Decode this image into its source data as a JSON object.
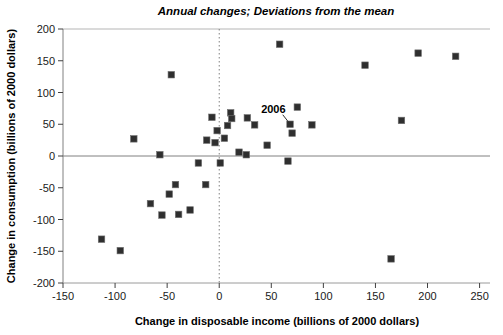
{
  "chart_data": {
    "type": "scatter",
    "title": "Annual changes; Deviations from the mean",
    "xlabel": "Change in disposable income (billions of 2000 dollars)",
    "ylabel": "Change in consumption (billions of 2000 dollars)",
    "xlim": [
      -150,
      260
    ],
    "ylim": [
      -200,
      200
    ],
    "x_ticks": [
      -150,
      -100,
      -50,
      0,
      50,
      100,
      150,
      200,
      250
    ],
    "y_ticks": [
      200,
      150,
      100,
      50,
      0,
      -50,
      -100,
      -150,
      -200
    ],
    "grid": false,
    "legend": null,
    "marker": {
      "shape": "square",
      "color": "#2f2f2f",
      "edge_color": "#6e6e6e",
      "size": 6.5
    },
    "reference_lines": {
      "horizontal_zero": {
        "value": 0,
        "style": "solid",
        "color": "#808080"
      },
      "vertical_zero": {
        "value": 0,
        "style": "dashed",
        "color": "#808080"
      }
    },
    "annotation": {
      "label": "2006",
      "label_at": [
        52,
        74
      ],
      "leader": [
        [
          61,
          65
        ],
        [
          66.5,
          53.5
        ]
      ],
      "point": [
        68,
        50
      ]
    },
    "points": [
      [
        -113,
        -131
      ],
      [
        -95,
        -149
      ],
      [
        -82,
        27
      ],
      [
        -66,
        -75
      ],
      [
        -57,
        2
      ],
      [
        -55,
        -93
      ],
      [
        -48,
        -60
      ],
      [
        -46,
        128
      ],
      [
        -42,
        -45
      ],
      [
        -39,
        -92
      ],
      [
        -28,
        -85
      ],
      [
        -20,
        -11
      ],
      [
        -13,
        -45
      ],
      [
        -12,
        25
      ],
      [
        -7,
        61
      ],
      [
        -4,
        21
      ],
      [
        -2,
        40
      ],
      [
        1,
        -11
      ],
      [
        5,
        28
      ],
      [
        8,
        48
      ],
      [
        11,
        68
      ],
      [
        12,
        59
      ],
      [
        19,
        6
      ],
      [
        26,
        2
      ],
      [
        27,
        60
      ],
      [
        34,
        49
      ],
      [
        46,
        17
      ],
      [
        58,
        176
      ],
      [
        66,
        -8
      ],
      [
        68,
        50
      ],
      [
        70,
        36
      ],
      [
        75,
        77
      ],
      [
        89,
        49
      ],
      [
        140,
        143
      ],
      [
        165,
        -162
      ],
      [
        175,
        56
      ],
      [
        191,
        162
      ],
      [
        227,
        157
      ]
    ]
  }
}
